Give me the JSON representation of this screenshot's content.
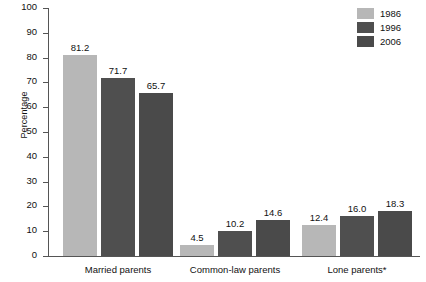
{
  "chart_data": {
    "type": "bar",
    "title": "",
    "subtitle": "",
    "xlabel": "",
    "ylabel": "Percentage",
    "ylim": [
      0,
      100
    ],
    "ytick_step": 10,
    "yticks": [
      0,
      10,
      20,
      30,
      40,
      50,
      60,
      70,
      80,
      90,
      100
    ],
    "grid": false,
    "legend_position": "top-right",
    "categories": [
      "Married parents",
      "Common-law parents",
      "Lone parents*"
    ],
    "series": [
      {
        "name": "1986",
        "color": "#b7b7b7",
        "values": [
          81.2,
          4.5,
          12.4
        ],
        "labels": [
          "81.2",
          "4.5",
          "12.4"
        ]
      },
      {
        "name": "1996",
        "color": "#4f4f4f",
        "values": [
          71.7,
          10.2,
          16.0
        ],
        "labels": [
          "71.7",
          "10.2",
          "16.0"
        ]
      },
      {
        "name": "2006",
        "color": "#4a4a4a",
        "values": [
          65.7,
          14.6,
          18.3
        ],
        "labels": [
          "65.7",
          "14.6",
          "18.3"
        ]
      }
    ],
    "footnote": "*"
  },
  "axis": {
    "y_title": "Percentage",
    "tick_labels": [
      "100",
      "90",
      "80",
      "70",
      "60",
      "50",
      "40",
      "30",
      "20",
      "10",
      "0"
    ]
  },
  "legend": {
    "entries": [
      {
        "label": "1986",
        "color": "#b7b7b7"
      },
      {
        "label": "1996",
        "color": "#4f4f4f"
      },
      {
        "label": "2006",
        "color": "#4a4a4a"
      }
    ]
  },
  "groups": [
    {
      "label": "Married parents",
      "bars": [
        {
          "series": "1986",
          "value": 81.2,
          "label": "81.2",
          "color": "#b7b7b7"
        },
        {
          "series": "1996",
          "value": 71.7,
          "label": "71.7",
          "color": "#4f4f4f"
        },
        {
          "series": "2006",
          "value": 65.7,
          "label": "65.7",
          "color": "#4a4a4a"
        }
      ]
    },
    {
      "label": "Common-law parents",
      "bars": [
        {
          "series": "1986",
          "value": 4.5,
          "label": "4.5",
          "color": "#b7b7b7"
        },
        {
          "series": "1996",
          "value": 10.2,
          "label": "10.2",
          "color": "#4f4f4f"
        },
        {
          "series": "2006",
          "value": 14.6,
          "label": "14.6",
          "color": "#4a4a4a"
        }
      ]
    },
    {
      "label": "Lone parents*",
      "bars": [
        {
          "series": "1986",
          "value": 12.4,
          "label": "12.4",
          "color": "#b7b7b7"
        },
        {
          "series": "1996",
          "value": 16.0,
          "label": "16.0",
          "color": "#4f4f4f"
        },
        {
          "series": "2006",
          "value": 18.3,
          "label": "18.3",
          "color": "#4a4a4a"
        }
      ]
    }
  ],
  "colors": {
    "axis": "#555555",
    "text": "#111111",
    "background": "#ffffff",
    "series_1986": "#b7b7b7",
    "series_1996": "#4f4f4f",
    "series_2006": "#4a4a4a"
  }
}
